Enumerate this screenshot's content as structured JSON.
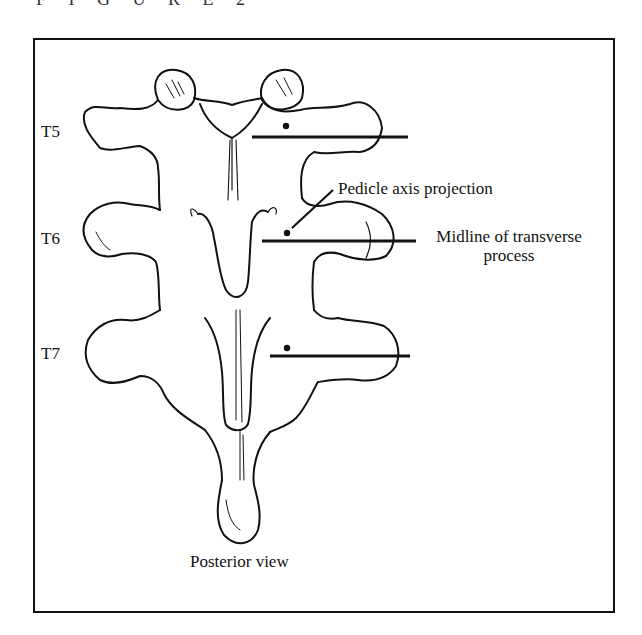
{
  "figure": {
    "title": "F I G U R E   2",
    "caption": "Posterior view"
  },
  "levels": [
    {
      "label": "T5"
    },
    {
      "label": "T6"
    },
    {
      "label": "T7"
    }
  ],
  "annotations": {
    "pedicle_axis": "Pedicle axis projection",
    "midline_line1": "Midline of transverse",
    "midline_line2": "process"
  },
  "colors": {
    "ink": "#111111",
    "background": "#ffffff",
    "frame": "#111111"
  }
}
